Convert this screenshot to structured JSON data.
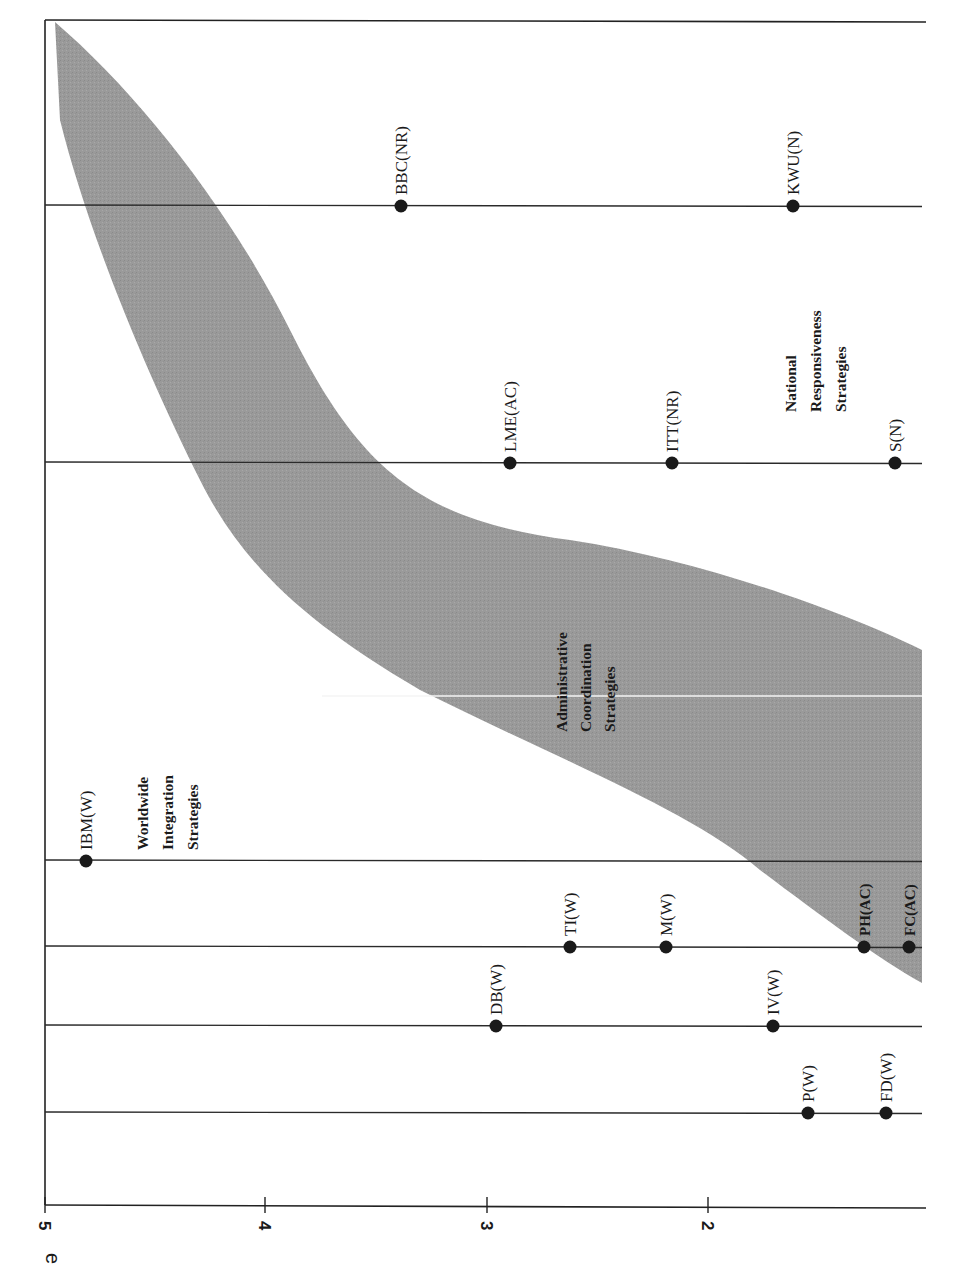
{
  "chart_data": {
    "type": "scatter",
    "orientation": "rotated-90-clockwise",
    "title": "",
    "ylabel_fragment": "e",
    "ylim": [
      1.2,
      5
    ],
    "yticks": [
      5,
      4,
      3,
      2
    ],
    "grid": false,
    "legend": null,
    "categories": [
      "Group 1",
      "Group 2",
      "Group 3",
      "Group 4",
      "Group 5",
      "Group 6",
      "Group 7"
    ],
    "series": [
      {
        "name": "P(W)",
        "category": 7,
        "value": 1.5,
        "strategy": "W"
      },
      {
        "name": "FD(W)",
        "category": 7,
        "value": 1.3,
        "strategy": "W"
      },
      {
        "name": "DB(W)",
        "category": 6,
        "value": 2.95,
        "strategy": "W"
      },
      {
        "name": "IV(W)",
        "category": 6,
        "value": 1.7,
        "strategy": "W"
      },
      {
        "name": "TI(W)",
        "category": 5,
        "value": 2.6,
        "strategy": "W"
      },
      {
        "name": "M(W)",
        "category": 5,
        "value": 2.2,
        "strategy": "W"
      },
      {
        "name": "PH(AC)",
        "category": 5,
        "value": 1.4,
        "strategy": "AC"
      },
      {
        "name": "FC(AC)",
        "category": 5,
        "value": 1.2,
        "strategy": "AC"
      },
      {
        "name": "IBM(W)",
        "category": 4,
        "value": 4.8,
        "strategy": "W"
      },
      {
        "name": "LME(AC)",
        "category": 3,
        "value": 2.9,
        "strategy": "AC"
      },
      {
        "name": "ITT(NR)",
        "category": 3,
        "value": 2.2,
        "strategy": "NR"
      },
      {
        "name": "S(N)",
        "category": 3,
        "value": 1.25,
        "strategy": "N"
      },
      {
        "name": "BBC(NR)",
        "category": 2,
        "value": 3.35,
        "strategy": "NR"
      },
      {
        "name": "KWU(N)",
        "category": 2,
        "value": 1.6,
        "strategy": "N"
      }
    ],
    "regions": [
      {
        "name": "Worldwide Integration Strategies",
        "lines": [
          "Worldwide",
          "Integration",
          "Strategies"
        ]
      },
      {
        "name": "Administrative Coordination Strategies",
        "lines": [
          "Administrative",
          "Coordination",
          "Strategies"
        ],
        "shaded": true
      },
      {
        "name": "National Responsiveness Strategies",
        "lines": [
          "National",
          "Responsiveness",
          "Strategies"
        ]
      }
    ],
    "band_color": "#9a9a9a"
  },
  "render": {
    "axis": {
      "x": 45,
      "top": 20,
      "bottom": 1205
    },
    "tick_y": 1205,
    "ticks": [
      {
        "label": "5",
        "x": 45
      },
      {
        "label": "4",
        "x": 265
      },
      {
        "label": "3",
        "x": 487
      },
      {
        "label": "2",
        "x": 708
      }
    ],
    "frame_top_y": 20,
    "lines": [
      {
        "id": "line-1",
        "y": 205,
        "x2": 922
      },
      {
        "id": "line-2",
        "y": 462,
        "x2": 922
      },
      {
        "id": "line-3",
        "y": 860,
        "x2": 922
      },
      {
        "id": "line-4",
        "y": 946,
        "x2": 922
      },
      {
        "id": "line-5",
        "y": 1025,
        "x2": 922
      },
      {
        "id": "line-6",
        "y": 1112,
        "x2": 922
      }
    ],
    "points": [
      {
        "label": "BBC(NR)",
        "x": 401,
        "y": 205,
        "bold": false
      },
      {
        "label": "KWU(N)",
        "x": 793,
        "y": 205,
        "bold": false
      },
      {
        "label": "LME(AC)",
        "x": 510,
        "y": 462,
        "bold": false
      },
      {
        "label": "ITT(NR)",
        "x": 672,
        "y": 462,
        "bold": false
      },
      {
        "label": "S(N)",
        "x": 895,
        "y": 462,
        "bold": false
      },
      {
        "label": "IBM(W)",
        "x": 86,
        "y": 860,
        "bold": false
      },
      {
        "label": "TI(W)",
        "x": 570,
        "y": 946,
        "bold": false
      },
      {
        "label": "M(W)",
        "x": 666,
        "y": 946,
        "bold": false
      },
      {
        "label": "PH(AC)",
        "x": 864,
        "y": 946,
        "bold": true
      },
      {
        "label": "FC(AC)",
        "x": 909,
        "y": 946,
        "bold": true
      },
      {
        "label": "DB(W)",
        "x": 496,
        "y": 1025,
        "bold": false
      },
      {
        "label": "IV(W)",
        "x": 773,
        "y": 1025,
        "bold": false
      },
      {
        "label": "P(W)",
        "x": 808,
        "y": 1112,
        "bold": false
      },
      {
        "label": "FD(W)",
        "x": 886,
        "y": 1112,
        "bold": false
      }
    ],
    "band_path": "M 55 22 C 140 95, 230 210, 290 330 C 360 470, 420 520, 570 540 C 700 560, 840 610, 922 650 L 922 983 C 880 960, 820 915, 760 870 C 690 810, 560 760, 420 690 C 300 620, 240 560, 200 480 C 150 380, 90 240, 60 120 Z",
    "scan_line": {
      "x1": 322,
      "y": 696,
      "x2": 922
    },
    "regions": [
      {
        "lines": [
          "Worldwide",
          "Integration",
          "Strategies"
        ],
        "x": 148,
        "y": 850,
        "dx": 25
      },
      {
        "lines": [
          "Administrative",
          "Coordination",
          "Strategies"
        ],
        "x": 567,
        "y": 732,
        "dx": 24
      },
      {
        "lines": [
          "National",
          "Responsiveness",
          "Strategies"
        ],
        "x": 796,
        "y": 412,
        "dx": 25
      }
    ],
    "axis_fragment": {
      "text": "e",
      "x": 60,
      "y": 1265
    }
  }
}
